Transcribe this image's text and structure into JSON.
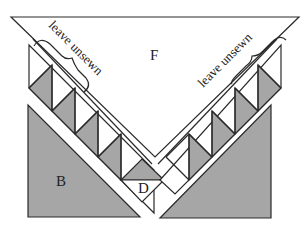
{
  "diagram": {
    "colors": {
      "shaded": "#a6a6a6",
      "line": "#2a2a2a",
      "background": "#ffffff"
    },
    "labels": {
      "top_piece": "F",
      "left_piece": "B",
      "center_piece": "D",
      "left_note": "leave unsewn",
      "right_note": "leave unsewn"
    },
    "pieces": [
      {
        "id": "F",
        "shape": "large triangle",
        "fill": "white"
      },
      {
        "id": "B",
        "shape": "right triangle",
        "fill": "shaded"
      },
      {
        "id": "right-triangle",
        "shape": "right triangle",
        "fill": "shaded"
      },
      {
        "id": "D",
        "shape": "small triangle",
        "fill": "white"
      },
      {
        "id": "left-strip",
        "shape": "half-square triangle strip",
        "units": 4
      },
      {
        "id": "right-strip",
        "shape": "half-square triangle strip",
        "units": 4
      }
    ]
  }
}
